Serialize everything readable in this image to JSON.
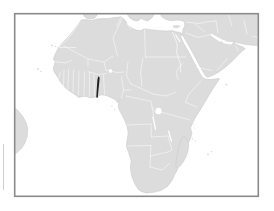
{
  "map": {
    "type": "locator-map",
    "description": "Blank political map of Africa with surrounding land fragments; one country filled dark",
    "highlighted_region": {
      "name": "Togo",
      "color": "#1f1f1f"
    },
    "landmasses": [
      "Africa",
      "Arabian Peninsula and Middle East",
      "Anatolia",
      "Iberian Peninsula fragment",
      "Italy-Greece fragment",
      "Madagascar",
      "South America fragment"
    ],
    "water_features": [
      "Mediterranean Sea",
      "Red Sea",
      "Persian Gulf",
      "Gulf of Aden",
      "Lake Victoria",
      "Nile River"
    ]
  },
  "colors": {
    "page-bg": "#ffffff",
    "ocean": "#ffffff",
    "land": "#dcdcdc",
    "coast": "#c6c6c6",
    "country-border": "#ffffff",
    "highlight": "#1f1f1f",
    "frame": "#8a8a8a",
    "edge-artifact": "#c9c9c9"
  }
}
